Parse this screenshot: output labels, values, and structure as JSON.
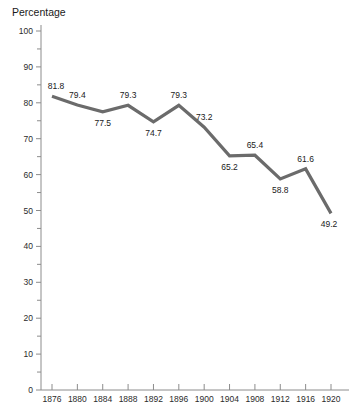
{
  "chart_data": {
    "type": "line",
    "title": "",
    "subtitle": "",
    "xlabel": "",
    "ylabel": "Percentage",
    "ylim": [
      0,
      100
    ],
    "ytick_step": 10,
    "yminor_step": 5,
    "grid": false,
    "legend": null,
    "x": [
      1876,
      1880,
      1884,
      1888,
      1892,
      1896,
      1900,
      1904,
      1908,
      1912,
      1916,
      1920
    ],
    "categories": [
      "1876",
      "1880",
      "1884",
      "1888",
      "1892",
      "1896",
      "1900",
      "1904",
      "1908",
      "1912",
      "1916",
      "1920"
    ],
    "values": [
      81.8,
      79.4,
      77.5,
      79.3,
      74.7,
      79.3,
      73.2,
      65.2,
      65.4,
      58.8,
      61.6,
      49.2
    ],
    "point_labels": [
      "81.8",
      "79.4",
      "77.5",
      "79.3",
      "74.7",
      "79.3",
      "73.2",
      "65.2",
      "65.4",
      "58.8",
      "61.6",
      "49.2"
    ],
    "label_positions": [
      "above",
      "above",
      "below",
      "above",
      "below",
      "above",
      "above",
      "below",
      "above",
      "below",
      "above",
      "below"
    ],
    "yticks": [
      {
        "value": 100,
        "label": "100"
      },
      {
        "value": 90,
        "label": "90"
      },
      {
        "value": 80,
        "label": "80"
      },
      {
        "value": 70,
        "label": "70"
      },
      {
        "value": 60,
        "label": "60"
      },
      {
        "value": 50,
        "label": "50"
      },
      {
        "value": 40,
        "label": "40"
      },
      {
        "value": 30,
        "label": "30"
      },
      {
        "value": 20,
        "label": "20"
      },
      {
        "value": 10,
        "label": "10"
      },
      {
        "value": 0,
        "label": "0"
      }
    ],
    "series_color": "#6b6b6b",
    "axis_color": "#8c8c8c",
    "text_color": "#1a1a1a"
  }
}
